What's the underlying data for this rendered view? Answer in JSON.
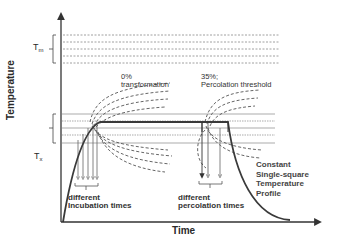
{
  "diagram": {
    "x_axis_label": "Time",
    "y_axis_label": "Temperature",
    "levels": {
      "tm": {
        "symbol": "T",
        "subscript": "m"
      },
      "tx": {
        "symbol": "T",
        "subscript": "x"
      }
    },
    "annotations": {
      "zero_percent_line1": "0%",
      "zero_percent_line2": "transformation",
      "threshold_line1": "35%;",
      "threshold_line2": "Percolation threshold",
      "incubation_line1": "different",
      "incubation_line2": "Incubation times",
      "percolation_line1": "different",
      "percolation_line2": "percolation times",
      "profile_line1": "Constant",
      "profile_line2": "Single-square",
      "profile_line3": "Temperature",
      "profile_line4": "Profile"
    },
    "colors": {
      "line": "#3a3a3a",
      "dashed": "#555555",
      "dotted": "#888888",
      "background": "#ffffff"
    }
  }
}
